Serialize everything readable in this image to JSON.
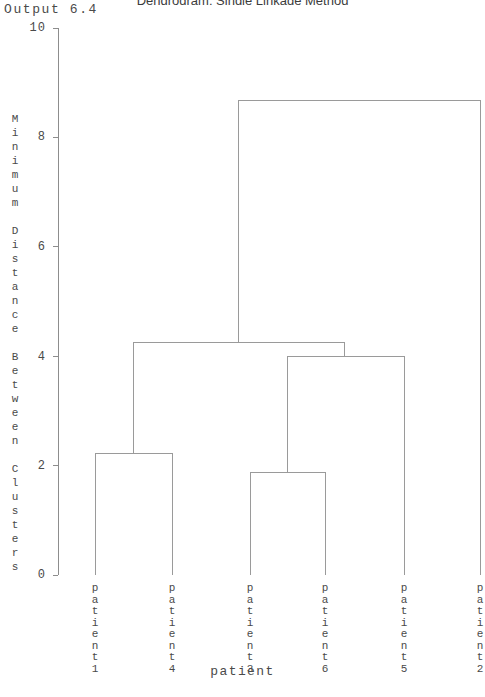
{
  "output_label": "Output 6.4",
  "title": "Dendrogram: Single Linkage Method",
  "axes": {
    "y_title": "Minimum Distance Between Clusters",
    "x_title": "patient",
    "y_ticks": [
      "10",
      "8",
      "6",
      "4",
      "2",
      "0"
    ],
    "y_tick_values": [
      10,
      8,
      6,
      4,
      2,
      0
    ],
    "ylim": [
      0,
      10
    ],
    "grid": false
  },
  "chart_data": {
    "type": "dendrogram",
    "title": "Dendrogram: Single Linkage Method",
    "xlabel": "patient",
    "ylabel": "Minimum Distance Between Clusters",
    "ylim": [
      0,
      10
    ],
    "yticks": [
      0,
      2,
      4,
      6,
      8,
      10
    ],
    "grid": false,
    "linkage_method": "single",
    "leaf_order": [
      "patient1",
      "patient4",
      "patient3",
      "patient6",
      "patient5",
      "patient2"
    ],
    "leaves": [
      {
        "label": "patient1",
        "x": 95
      },
      {
        "label": "patient4",
        "x": 172
      },
      {
        "label": "patient3",
        "x": 250
      },
      {
        "label": "patient6",
        "x": 325
      },
      {
        "label": "patient5",
        "x": 404
      },
      {
        "label": "patient2",
        "x": 480
      }
    ],
    "merges": [
      {
        "id": "m1",
        "left": "patient3",
        "right": "patient6",
        "height": 1.87,
        "x_left": 250,
        "x_right": 325
      },
      {
        "id": "m2",
        "left": "patient1",
        "right": "patient4",
        "height": 2.22,
        "x_left": 95,
        "x_right": 172
      },
      {
        "id": "m3",
        "left": "m1",
        "right": "patient5",
        "height": 4.0,
        "x_left": 287,
        "x_right": 404
      },
      {
        "id": "m4",
        "left": "m2",
        "right": "m3",
        "height": 4.25,
        "x_left": 133,
        "x_right": 344
      },
      {
        "id": "m5",
        "left": "m4",
        "right": "patient2",
        "height": 8.67,
        "x_left": 238,
        "x_right": 480
      }
    ],
    "merge_heights": [
      1.87,
      2.22,
      4.0,
      4.25,
      8.67
    ]
  },
  "colors": {
    "line": "#9a9a9a",
    "axis": "#8d8d8d",
    "text": "#4a4a4a",
    "title": "#3c3c3c",
    "background": "#ffffff"
  }
}
